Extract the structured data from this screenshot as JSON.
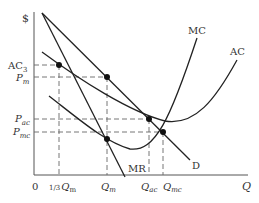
{
  "diagram": {
    "y_axis_label": "$",
    "x_axis_label": "Q",
    "origin_label": "0",
    "curves": [
      {
        "name": "MC",
        "label": "MC"
      },
      {
        "name": "AC",
        "label": "AC"
      },
      {
        "name": "D",
        "label": "D"
      },
      {
        "name": "MR",
        "label": "MR"
      }
    ],
    "y_labels": {
      "ac3": {
        "main": "AC",
        "sub": "3"
      },
      "pm": {
        "main": "P",
        "sub": "m"
      },
      "pac": {
        "main": "P",
        "sub": "ac"
      },
      "pmc": {
        "main": "P",
        "sub": "mc"
      }
    },
    "x_labels": {
      "third_qm": {
        "prefix": "1/3",
        "main": "Q",
        "sub": "m"
      },
      "qm": {
        "main": "Q",
        "sub": "m"
      },
      "qac": {
        "main": "Q",
        "sub": "ac"
      },
      "qmc": {
        "main": "Q",
        "sub": "mc"
      }
    },
    "colors": {
      "curve": "#222222",
      "dashed": "#666666",
      "text": "#333333"
    }
  }
}
